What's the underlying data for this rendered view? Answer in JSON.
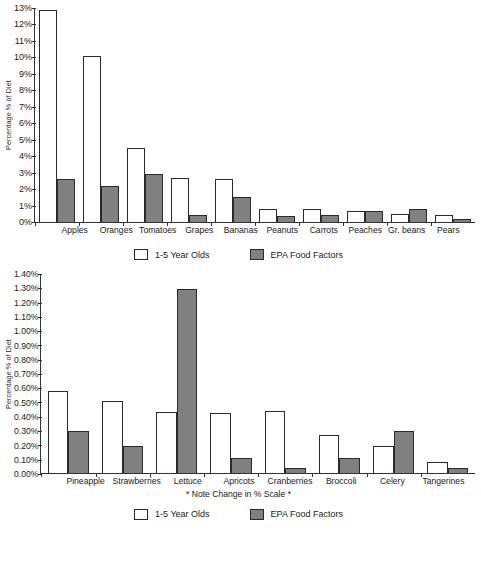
{
  "colors": {
    "series_light_fill": "#FFFFFF",
    "series_dark_fill": "#808080",
    "outline": "#2A2A2A",
    "axis": "#333333",
    "background": "#FFFFFF"
  },
  "legend": {
    "light_label": "1-5 Year Olds",
    "dark_label": "EPA Food Factors"
  },
  "footnote": "* Note Change in % Scale *",
  "chart_data": [
    {
      "id": "top",
      "type": "bar",
      "title": "",
      "xlabel": "",
      "ylabel": "Percentage % of Diet",
      "ylim": [
        0,
        13
      ],
      "ytick_labels": [
        "13%",
        "12%",
        "11%",
        "10%",
        "9%",
        "8%",
        "7%",
        "6%",
        "5%",
        "4%",
        "3%",
        "2%",
        "1%",
        "0%"
      ],
      "ytick_values": [
        13,
        12,
        11,
        10,
        9,
        8,
        7,
        6,
        5,
        4,
        3,
        2,
        1,
        0
      ],
      "grid": false,
      "legend_position": "bottom",
      "categories": [
        "Apples",
        "Oranges",
        "Tomatoes",
        "Grapes",
        "Bananas",
        "Peanuts",
        "Carrots",
        "Peaches",
        "Gr. beans",
        "Pears"
      ],
      "series": [
        {
          "name": "1-5 Year Olds",
          "values": [
            12.9,
            10.1,
            4.5,
            2.7,
            2.6,
            0.8,
            0.8,
            0.65,
            0.5,
            0.4
          ]
        },
        {
          "name": "EPA Food Factors",
          "values": [
            2.6,
            2.2,
            2.9,
            0.4,
            1.5,
            0.35,
            0.4,
            0.65,
            0.8,
            0.2
          ]
        }
      ]
    },
    {
      "id": "bottom",
      "type": "bar",
      "title": "",
      "xlabel": "* Note Change in % Scale *",
      "ylabel": "Percentage % of Diet",
      "ylim": [
        0,
        1.4
      ],
      "ytick_labels": [
        "1.40%",
        "1.30%",
        "1.20%",
        "1.10%",
        "1.00%",
        "0.90%",
        "0.80%",
        "0.70%",
        "0.60%",
        "0.50%",
        "0.40%",
        "0.30%",
        "0.20%",
        "0.10%",
        "0.00%"
      ],
      "ytick_values": [
        1.4,
        1.3,
        1.2,
        1.1,
        1.0,
        0.9,
        0.8,
        0.7,
        0.6,
        0.5,
        0.4,
        0.3,
        0.2,
        0.1,
        0.0
      ],
      "grid": false,
      "legend_position": "bottom",
      "categories": [
        "Pineapple",
        "Strawberries",
        "Lettuce",
        "Apricots",
        "Cranberries",
        "Broccoli",
        "Celery",
        "Tangerines"
      ],
      "series": [
        {
          "name": "1-5 Year Olds",
          "values": [
            0.58,
            0.51,
            0.43,
            0.425,
            0.44,
            0.27,
            0.19,
            0.08
          ]
        },
        {
          "name": "EPA Food Factors",
          "values": [
            0.3,
            0.19,
            1.3,
            0.11,
            0.04,
            0.11,
            0.3,
            0.035
          ]
        }
      ]
    }
  ]
}
